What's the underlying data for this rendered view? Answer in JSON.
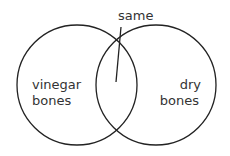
{
  "diagram": {
    "type": "venn",
    "sets": [
      {
        "label_line1": "vinegar",
        "label_line2": "bones"
      },
      {
        "label_line1": "dry",
        "label_line2": "bones"
      }
    ],
    "intersection_label": "same",
    "colors": {
      "stroke": "#222222",
      "text": "#333333",
      "background": "#ffffff"
    }
  }
}
